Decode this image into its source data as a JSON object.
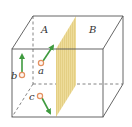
{
  "diagram": {
    "type": "cube-with-dividing-plane",
    "regions": [
      {
        "label": "A",
        "x": 45,
        "y": 33
      },
      {
        "label": "B",
        "x": 92,
        "y": 33
      }
    ],
    "particles": [
      {
        "label": "a",
        "cx": 41,
        "cy": 63,
        "label_x": 38,
        "label_y": 74,
        "arrow_to": [
          54,
          45
        ]
      },
      {
        "label": "b",
        "cx": 22,
        "cy": 75,
        "label_x": 11,
        "label_y": 79,
        "arrow_to": [
          22,
          54
        ]
      },
      {
        "label": "c",
        "cx": 40,
        "cy": 96,
        "label_x": 29,
        "label_y": 100,
        "arrow_to": [
          51,
          115
        ]
      }
    ],
    "colors": {
      "edge": "#555555",
      "plane": "#eedc9a",
      "plane_stripe": "#e2cc7e",
      "arrow": "#3f9a3f",
      "particle": "#e39060"
    }
  }
}
